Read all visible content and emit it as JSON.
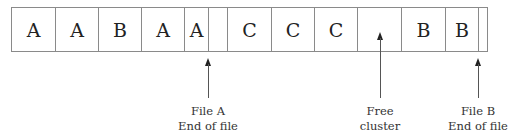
{
  "diagram": {
    "clusters": [
      {
        "label": "A",
        "type": "file-a"
      },
      {
        "label": "A",
        "type": "file-a"
      },
      {
        "label": "B",
        "type": "file-b"
      },
      {
        "label": "A",
        "type": "file-a"
      },
      {
        "label": "A",
        "type": "file-a-partial"
      },
      {
        "label": "",
        "type": "slack"
      },
      {
        "label": "C",
        "type": "file-c"
      },
      {
        "label": "C",
        "type": "file-c"
      },
      {
        "label": "C",
        "type": "file-c"
      },
      {
        "label": "",
        "type": "free"
      },
      {
        "label": "B",
        "type": "file-b"
      },
      {
        "label": "B",
        "type": "file-b-partial"
      },
      {
        "label": "",
        "type": "slack"
      }
    ],
    "annotations": [
      {
        "line1": "File A",
        "line2": "End of file"
      },
      {
        "line1": "Free",
        "line2": "cluster"
      },
      {
        "line1": "File B",
        "line2": "End of file"
      }
    ]
  }
}
